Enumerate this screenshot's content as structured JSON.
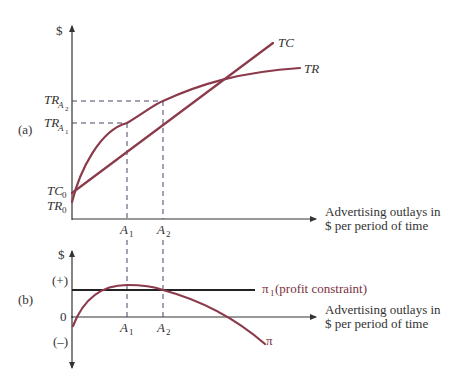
{
  "panel_a": {
    "tag": "(a)",
    "y_axis_label": "$",
    "x_axis_label_line1": "Advertising outlays in",
    "x_axis_label_line2": "$ per period of time",
    "curves": {
      "tc_label": "TC",
      "tr_label": "TR"
    },
    "y_ticks": {
      "tr_a2": {
        "base": "TR",
        "sub": "A",
        "subsub": "2"
      },
      "tr_a1": {
        "base": "TR",
        "sub": "A",
        "subsub": "1"
      },
      "tc0": {
        "base": "TC",
        "sub": "0"
      },
      "tr0": {
        "base": "TR",
        "sub": "0"
      }
    },
    "x_ticks": {
      "a1": {
        "base": "A",
        "sub": "1"
      },
      "a2": {
        "base": "A",
        "sub": "2"
      }
    }
  },
  "panel_b": {
    "tag": "(b)",
    "y_axis_label": "$",
    "plus_label": "(+)",
    "zero_label": "0",
    "minus_label": "(–)",
    "x_axis_label_line1": "Advertising outlays in",
    "x_axis_label_line2": "$ per period of time",
    "constraint_symbol": "π",
    "constraint_sub": "1",
    "constraint_text": " (profit constraint)",
    "profit_curve_label": "π",
    "x_ticks": {
      "a1": {
        "base": "A",
        "sub": "1"
      },
      "a2": {
        "base": "A",
        "sub": "2"
      }
    }
  },
  "colors": {
    "curve": "#8a3a4a",
    "axis": "#333333",
    "constraint": "#222222"
  }
}
